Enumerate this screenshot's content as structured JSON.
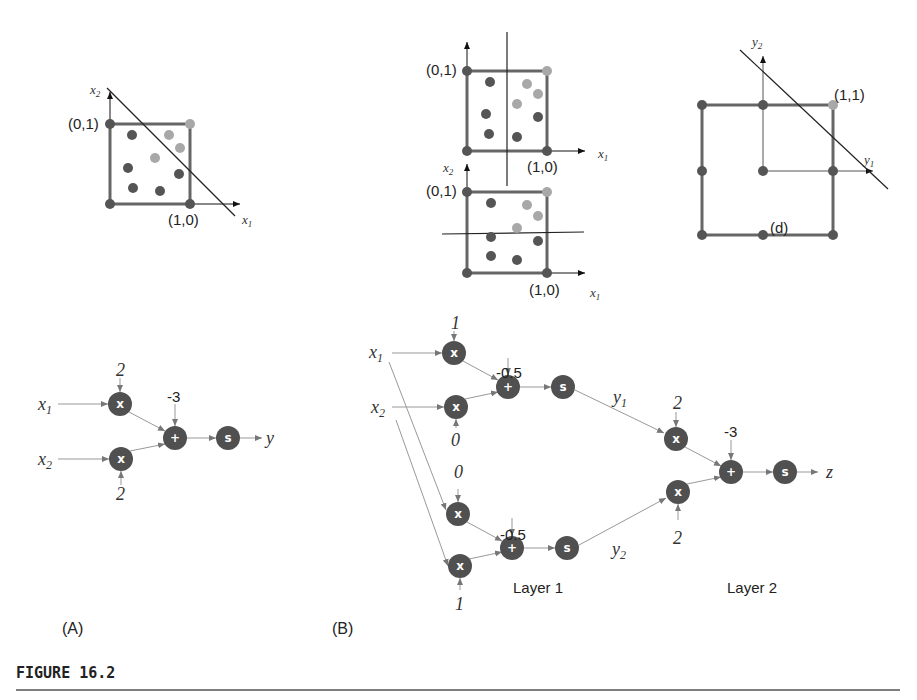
{
  "figure": {
    "caption": "FIGURE 16.2",
    "panel_labels": {
      "a": "(A)",
      "b": "(B)"
    },
    "layer_labels": {
      "layer1": "Layer 1",
      "layer2": "Layer 2"
    }
  },
  "plots": {
    "a": {
      "x_axis": "x1",
      "y_axis": "x2",
      "label_01": "(0,1)",
      "label_10": "(1,0)"
    },
    "b_top": {
      "x_axis": "x1",
      "label_01": "(0,1)",
      "label_10": "(1,0)"
    },
    "b_bottom": {
      "x_axis": "x1",
      "y_axis": "x2",
      "label_01": "(0,1)",
      "label_10": "(1,0)"
    },
    "d": {
      "x_axis": "y1",
      "y_axis": "y2",
      "label_11": "(1,1)",
      "label_d": "(d)"
    }
  },
  "network_a": {
    "inputs": [
      "x1",
      "x2"
    ],
    "weights": [
      "2",
      "2"
    ],
    "bias": "-3",
    "output": "y",
    "node_labels": {
      "mult": "x",
      "sum": "+",
      "sigmoid": "s"
    }
  },
  "network_b": {
    "inputs": [
      "x1",
      "x2"
    ],
    "layer1": {
      "unit1": {
        "weights": [
          "1",
          "0"
        ],
        "bias": "-0.5",
        "output": "y1"
      },
      "unit2": {
        "weights": [
          "0",
          "1"
        ],
        "bias": "-0.5",
        "output": "y2"
      }
    },
    "layer2": {
      "weights": [
        "2",
        "2"
      ],
      "bias": "-3",
      "output": "z"
    },
    "node_labels": {
      "mult": "x",
      "sum": "+",
      "sigmoid": "s"
    }
  },
  "colors": {
    "dark_dot": "#555555",
    "light_dot": "#a8a8a8",
    "node": "#505050",
    "square": "#666666",
    "line": "#222222",
    "arrow": "#999999"
  }
}
